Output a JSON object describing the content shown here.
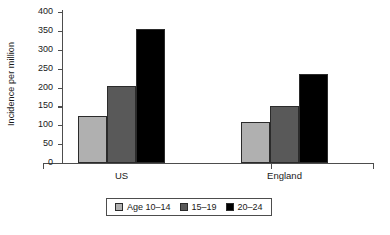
{
  "chart_data": {
    "type": "bar",
    "title": "",
    "xlabel": "",
    "ylabel": "Incidence per million",
    "categories": [
      "US",
      "England"
    ],
    "series": [
      {
        "name": "Age 10–14",
        "values": [
          124,
          109
        ],
        "color": "#b0b0b0"
      },
      {
        "name": "15–19",
        "values": [
          204,
          151
        ],
        "color": "#595959"
      },
      {
        "name": "20–24",
        "values": [
          355,
          236
        ],
        "color": "#000000"
      }
    ],
    "ylim": [
      0,
      400
    ],
    "ytick_values": [
      0,
      50,
      100,
      150,
      200,
      250,
      300,
      350,
      400
    ],
    "ytick_labels": [
      "0",
      "50",
      "100",
      "150",
      "200",
      "250",
      "300",
      "350",
      "400"
    ],
    "grid": false,
    "legend_position": "bottom-center",
    "legend_entries": [
      "Age 10–14",
      "15–19",
      "20–24"
    ]
  },
  "axis": {
    "y_title": "Incidence per million",
    "ticks": [
      {
        "label": "400",
        "value": 400
      },
      {
        "label": "350",
        "value": 350
      },
      {
        "label": "300",
        "value": 300
      },
      {
        "label": "250",
        "value": 250
      },
      {
        "label": "200",
        "value": 200
      },
      {
        "label": "150",
        "value": 150
      },
      {
        "label": "100",
        "value": 100
      },
      {
        "label": "50",
        "value": 50
      },
      {
        "label": "0",
        "value": 0
      }
    ],
    "group_labels": [
      "US",
      "England"
    ]
  },
  "legend": {
    "items": [
      {
        "label": "Age 10–14",
        "color": "#b0b0b0"
      },
      {
        "label": "15–19",
        "color": "#595959"
      },
      {
        "label": "20–24",
        "color": "#000000"
      }
    ]
  }
}
